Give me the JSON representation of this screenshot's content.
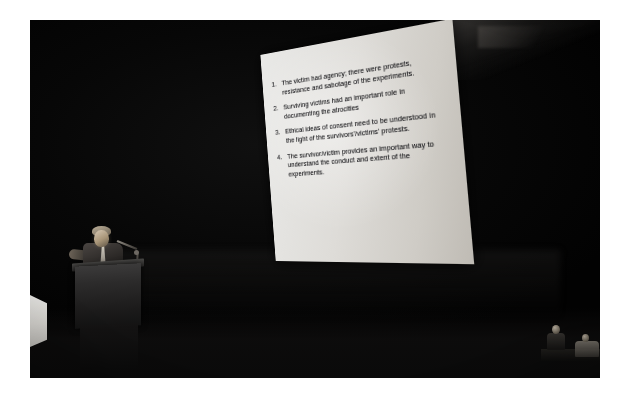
{
  "photo": {
    "scene_description": "Darkened auditorium lecture hall with an illuminated projection screen",
    "background_color": "#050505",
    "frame_color": "#ffffff"
  },
  "slide": {
    "screen_color": "#e3e1dd",
    "text_color": "#16161a",
    "bullets": [
      {
        "number": "1.",
        "text": "The victim had agency; there were protests, resistance and sabotage of the experiments."
      },
      {
        "number": "2.",
        "text": "Surviving victims had an important role in documenting the atrocities"
      },
      {
        "number": "3.",
        "text": "Ethical ideas of consent need to be understood in the light of the survivors'/victims' protests."
      },
      {
        "number": "4.",
        "text": "The survivor/victim provides an important way to understand the conduct and extent of the experiments."
      }
    ]
  },
  "stage": {
    "speaker": {
      "label": "speaker-at-podium",
      "podium_label": "lectern",
      "microphone_label": "gooseneck-microphone"
    },
    "light_wedge_label": "stage-light-spill",
    "audience": [
      {
        "label": "seated-figure-left"
      },
      {
        "label": "seated-figure-right"
      }
    ],
    "ceiling_label": "ceiling-truss-structure"
  }
}
